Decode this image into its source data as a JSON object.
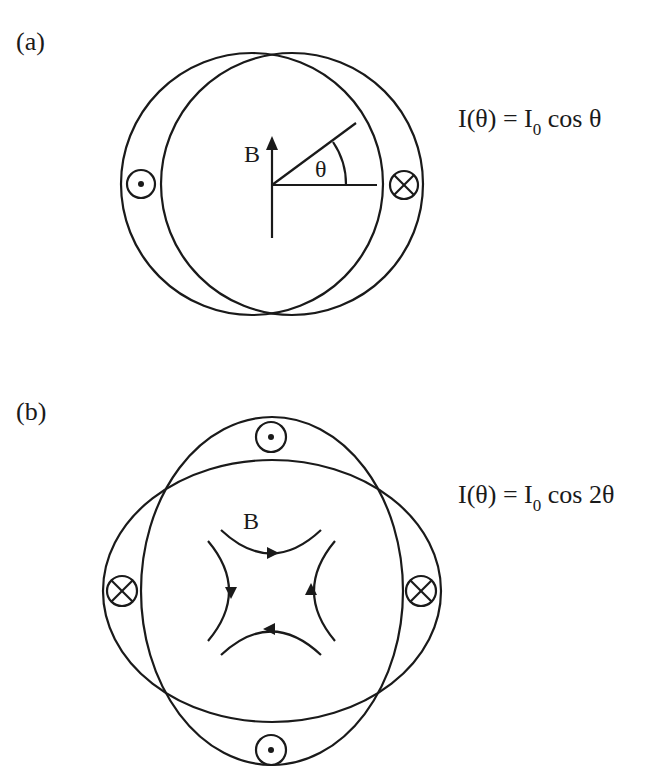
{
  "panels": [
    {
      "label": "(a)",
      "equation": {
        "lhs": "I(θ) = I",
        "subscript": "0",
        "rhs": " cos θ"
      },
      "field_label": "B",
      "angle_label": "θ",
      "symbols": {
        "left": "current-out-of-page (dot)",
        "right": "current-into-page (cross)"
      }
    },
    {
      "label": "(b)",
      "equation": {
        "lhs": "I(θ) = I",
        "subscript": "0",
        "rhs": " cos 2θ"
      },
      "field_label": "B",
      "symbols": {
        "top": "current-out-of-page (dot)",
        "bottom": "current-out-of-page (dot)",
        "left": "current-into-page (cross)",
        "right": "current-into-page (cross)"
      }
    }
  ],
  "colors": {
    "stroke": "#1a1a1a",
    "background": "#ffffff"
  }
}
